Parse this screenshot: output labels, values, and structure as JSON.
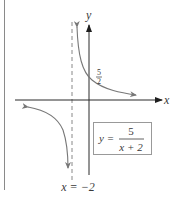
{
  "figure": {
    "function_label": {
      "prefix": "y =",
      "numerator": "5",
      "denominator": "x + 2"
    },
    "axis_labels": {
      "x": "x",
      "y": "y"
    },
    "y_intercept_label": {
      "numerator": "5",
      "denominator": "2"
    },
    "asymptote_label": "x = −2",
    "colors": {
      "axes": "#2a2a2a",
      "curve": "#777777",
      "asymptote": "#888888",
      "box_border": "#999999",
      "text": "#3a3a3a"
    }
  }
}
